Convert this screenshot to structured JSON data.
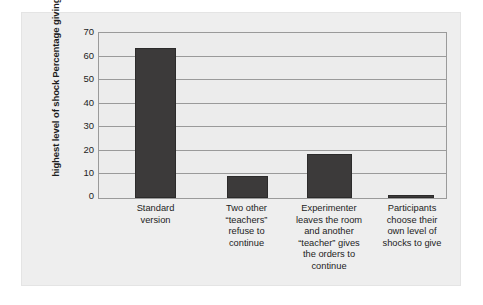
{
  "chart_data": {
    "type": "bar",
    "title": "",
    "subtitle": "",
    "xlabel": "",
    "ylabel": "Percentage giving the highest level of shock",
    "ylabel_lines": [
      "Percentage giving the",
      "highest level of shock"
    ],
    "categories": [
      "Standard version",
      "Two other \"teachers\" refuse to continue",
      "Experimenter leaves the room and another \"teacher\" gives the orders to continue",
      "Participants choose their own level of shocks to give"
    ],
    "category_lines": [
      [
        "Standard",
        "version"
      ],
      [
        "Two other",
        "“teachers”",
        "refuse to",
        "continue"
      ],
      [
        "Experimenter",
        "leaves the room",
        "and another",
        "“teacher” gives",
        "the orders to",
        "continue"
      ],
      [
        "Participants",
        "choose their",
        "own level of",
        "shocks to give"
      ]
    ],
    "values": [
      64.5,
      9.5,
      19.0,
      1.5
    ],
    "ylim": [
      0,
      70
    ],
    "yticks": [
      70,
      60,
      50,
      40,
      30,
      20,
      10,
      0
    ],
    "ytick_labels": [
      "70",
      "60",
      "50",
      "40",
      "30",
      "20",
      "10",
      "0"
    ],
    "grid": true,
    "legend": false,
    "legend_position": "none",
    "bar_color": "#3c3a3a",
    "plot_background": "#ececec",
    "figure_background": "#eeeeee",
    "axis_color": "#9a9a9a"
  }
}
